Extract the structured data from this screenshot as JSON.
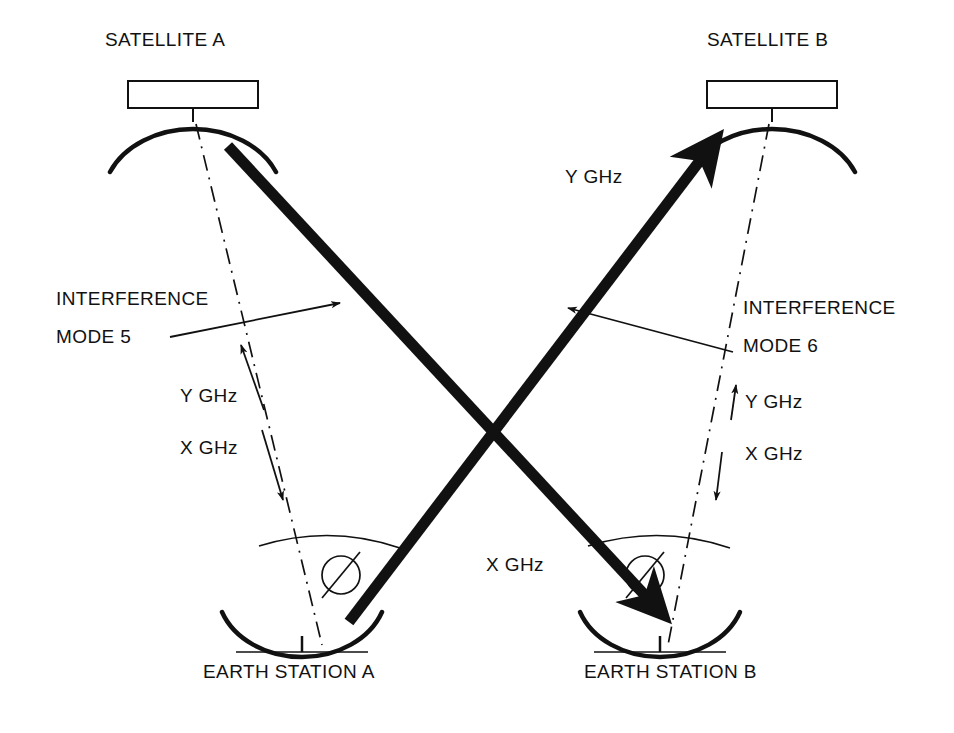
{
  "figure": {
    "type": "technical-diagram",
    "background_color": "#ffffff",
    "ink_color": "#111111",
    "top_edge_text": "",
    "width": 954,
    "height": 733
  },
  "satellites": [
    {
      "id": "satellite-a",
      "label": "SATELLITE A",
      "x": 193,
      "y": 40
    },
    {
      "id": "satellite-b",
      "label": "SATELLITE B",
      "x": 773,
      "y": 40
    }
  ],
  "earth_stations": [
    {
      "id": "earth-station-a",
      "label": "EARTH STATION A",
      "x": 300,
      "y": 672
    },
    {
      "id": "earth-station-b",
      "label": "EARTH STATION B",
      "x": 697,
      "y": 672
    }
  ],
  "interference_labels": [
    {
      "id": "interference-mode-5",
      "line1": "INTERFERENCE",
      "line2": "MODE 5",
      "x": 60,
      "y": 296
    },
    {
      "id": "interference-mode-6",
      "line1": "INTERFERENCE",
      "line2": "MODE 6",
      "x": 745,
      "y": 305
    }
  ],
  "band_labels": [
    {
      "id": "band-left-uplink",
      "text": "Y GHz",
      "x": 187,
      "y": 392,
      "direction": "up"
    },
    {
      "id": "band-left-downlink",
      "text": "X GHz",
      "x": 187,
      "y": 444,
      "direction": "down"
    },
    {
      "id": "band-right-uplink",
      "text": "Y GHz",
      "x": 748,
      "y": 398,
      "direction": "up"
    },
    {
      "id": "band-right-downlink",
      "text": "X GHz",
      "x": 748,
      "y": 450,
      "direction": "down"
    },
    {
      "id": "band-beam-to-satellite-b",
      "text": "Y GHz",
      "x": 568,
      "y": 173,
      "direction": "up-right"
    },
    {
      "id": "band-beam-to-earth-station-b",
      "text": "X GHz",
      "x": 489,
      "y": 561,
      "direction": "down-right"
    }
  ],
  "angle_symbols": [
    {
      "id": "angle-symbol-a",
      "glyph": "Ø",
      "x": 341,
      "y": 575
    },
    {
      "id": "angle-symbol-b",
      "glyph": "Ø",
      "x": 645,
      "y": 575
    }
  ],
  "beams": [
    {
      "id": "beam-satellite-a-to-earth-station-b",
      "band": "X GHz",
      "from": "satellite-a",
      "to": "earth-station-b",
      "style": "thick-solid-arrow"
    },
    {
      "id": "beam-earth-station-a-to-satellite-b",
      "band": "Y GHz",
      "from": "earth-station-a",
      "to": "satellite-b",
      "style": "thick-solid-arrow"
    }
  ],
  "link_paths": [
    {
      "id": "link-satellite-a-earth-station-a",
      "style": "dash-dot",
      "bands": [
        "Y GHz",
        "X GHz"
      ]
    },
    {
      "id": "link-satellite-b-earth-station-b",
      "style": "dash-dot",
      "bands": [
        "Y GHz",
        "X GHz"
      ]
    }
  ]
}
